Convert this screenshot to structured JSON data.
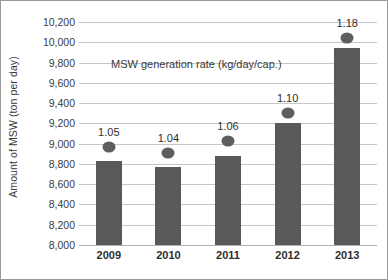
{
  "chart_data": {
    "type": "bar",
    "title": "",
    "subtitle": "",
    "annotation": "MSW generation rate (kg/day/cap.)",
    "categories": [
      "2009",
      "2010",
      "2011",
      "2012",
      "2013"
    ],
    "xlabel": "",
    "ylabel": "Amount of MSW (ton per day)",
    "ylim": [
      8000,
      10200
    ],
    "ytick_labels": [
      "10,200",
      "10,000",
      "9,800",
      "9,600",
      "9,400",
      "9,200",
      "9,000",
      "8,800",
      "8,600",
      "8,400",
      "8,200",
      "8,000"
    ],
    "ytick_values": [
      10200,
      10000,
      9800,
      9600,
      9400,
      9200,
      9000,
      8800,
      8600,
      8400,
      8200,
      8000
    ],
    "grid": true,
    "legend": "none",
    "series": [
      {
        "name": "Amount of MSW (ton per day)",
        "type": "bar",
        "color": "#595959",
        "values": [
          8830,
          8770,
          8880,
          9200,
          9940
        ]
      },
      {
        "name": "MSW generation rate (kg/day/cap.)",
        "type": "scatter",
        "color": "#5e5e5e",
        "values": [
          1.05,
          1.04,
          1.06,
          1.1,
          1.18
        ],
        "labels": [
          "1.05",
          "1.04",
          "1.06",
          "1.10",
          "1.18"
        ],
        "plot_positions": [
          8970,
          8910,
          9030,
          9300,
          10040
        ]
      }
    ],
    "colors": {
      "bar": "#595959",
      "marker": "#5e5e5e",
      "grid": "#c6c6c6",
      "text": "#2e2e2e",
      "background": "#ffffff"
    }
  }
}
